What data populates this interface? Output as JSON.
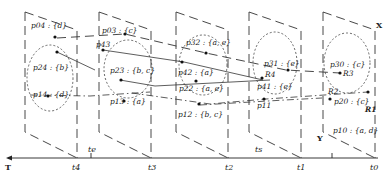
{
  "axis": {
    "label": "T",
    "ticks": [
      "t4",
      "t3",
      "t2",
      "t1",
      "t0"
    ],
    "te_label": "te",
    "ts_label": "ts",
    "x_label": "X",
    "y_label": "Y"
  },
  "planes": [
    {
      "time": "t4",
      "points": [
        {
          "id": "p04",
          "label": "p04 : {d}"
        },
        {
          "id": "p24",
          "label": "p24 : {b}"
        },
        {
          "id": "p14",
          "label": "p14 : {d}"
        }
      ]
    },
    {
      "time": "t3",
      "points": [
        {
          "id": "p03",
          "label": "p03 : {c}"
        },
        {
          "id": "p43",
          "label": "p43"
        },
        {
          "id": "p23",
          "label": "p23 : {b, c}"
        },
        {
          "id": "p13",
          "label": "p13 : {a}"
        }
      ]
    },
    {
      "time": "t2",
      "points": [
        {
          "id": "p32",
          "label": "p32 : {a, e}"
        },
        {
          "id": "p42",
          "label": "p42 : {a}"
        },
        {
          "id": "p22",
          "label": "p22 : {a, e}"
        },
        {
          "id": "p12",
          "label": "p12 : {b, c}"
        }
      ]
    },
    {
      "time": "t1",
      "points": [
        {
          "id": "p31",
          "label": "p31 : {e}"
        },
        {
          "id": "p41",
          "label": "p41 : {e}"
        },
        {
          "id": "p11",
          "label": "p11"
        }
      ]
    },
    {
      "time": "t0",
      "points": [
        {
          "id": "p30",
          "label": "p30 : {c}"
        },
        {
          "id": "p20",
          "label": "p20 : {c}"
        },
        {
          "id": "p10",
          "label": "p10 : {a, d}"
        }
      ]
    }
  ],
  "regions": [
    "R1",
    "R2",
    "R3",
    "R4"
  ]
}
